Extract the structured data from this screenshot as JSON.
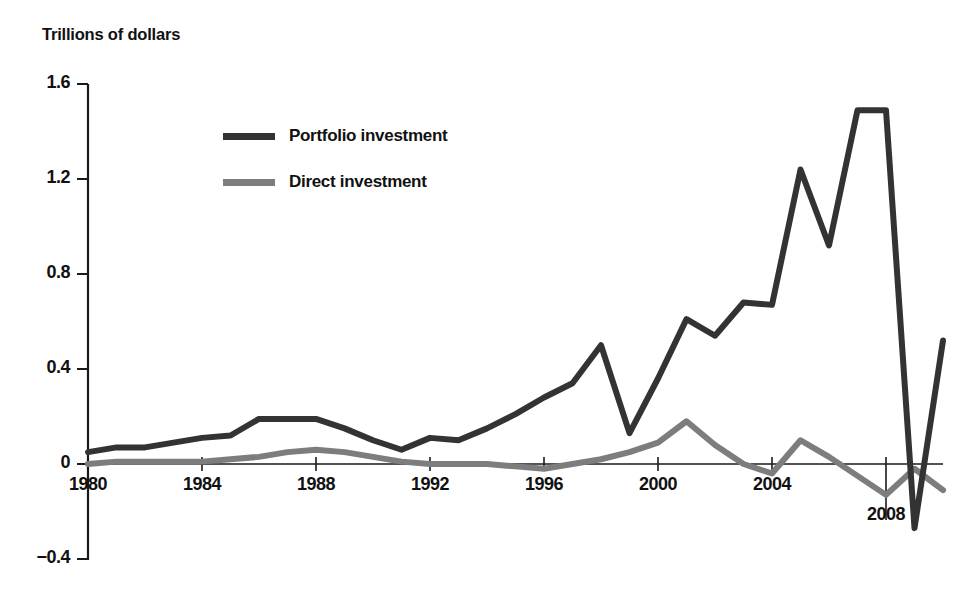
{
  "figure": {
    "cropped_header_text": "",
    "axis_title": "Trillions of dollars"
  },
  "legend": {
    "position": "inside-top-left",
    "entries": [
      {
        "label": "Portfolio investment",
        "color": "#333333",
        "icon": "line-swatch-icon"
      },
      {
        "label": "Direct investment",
        "color": "#7d7d7d",
        "icon": "line-swatch-icon"
      }
    ]
  },
  "axes": {
    "y_ticks": [
      "1.6",
      "1.2",
      "0.8",
      "0.4",
      "0",
      "−0.4"
    ],
    "y_tick_values": [
      1.6,
      1.2,
      0.8,
      0.4,
      0,
      -0.4
    ],
    "x_ticks": [
      "1980",
      "1984",
      "1988",
      "1992",
      "1996",
      "2000",
      "2004",
      "2008"
    ],
    "x_tick_values": [
      1980,
      1984,
      1988,
      1992,
      1996,
      2000,
      2004,
      2008
    ]
  },
  "chart_data": {
    "type": "line",
    "title": "",
    "subtitle": "",
    "xlabel": "",
    "ylabel": "Trillions of dollars",
    "xlim": [
      1980,
      2010
    ],
    "ylim": [
      -0.4,
      1.6
    ],
    "grid": false,
    "legend_position": "inside-top-left",
    "x": [
      1980,
      1981,
      1982,
      1983,
      1984,
      1985,
      1986,
      1987,
      1988,
      1989,
      1990,
      1991,
      1992,
      1993,
      1994,
      1995,
      1996,
      1997,
      1998,
      1999,
      2000,
      2001,
      2002,
      2003,
      2004,
      2005,
      2006,
      2007,
      2008,
      2009,
      2010
    ],
    "series": [
      {
        "name": "Portfolio investment",
        "color": "#333333",
        "values": [
          0.05,
          0.07,
          0.07,
          0.09,
          0.11,
          0.12,
          0.19,
          0.19,
          0.19,
          0.15,
          0.1,
          0.06,
          0.11,
          0.1,
          0.15,
          0.21,
          0.28,
          0.34,
          0.5,
          0.13,
          0.36,
          0.61,
          0.54,
          0.68,
          0.67,
          1.24,
          0.92,
          1.49,
          1.49,
          -0.27,
          0.52
        ]
      },
      {
        "name": "Direct investment",
        "color": "#7d7d7d",
        "values": [
          0.0,
          0.01,
          0.01,
          0.01,
          0.01,
          0.02,
          0.03,
          0.05,
          0.06,
          0.05,
          0.03,
          0.01,
          0.0,
          0.0,
          0.0,
          -0.01,
          -0.02,
          0.0,
          0.02,
          0.05,
          0.09,
          0.18,
          0.08,
          0.0,
          -0.04,
          0.1,
          0.03,
          -0.05,
          -0.13,
          -0.02,
          -0.11
        ]
      }
    ],
    "annotations": [
      {
        "text": "1980",
        "kind": "x-tick-label"
      },
      {
        "text": "2008",
        "kind": "x-tick-label-below-axis"
      }
    ]
  }
}
